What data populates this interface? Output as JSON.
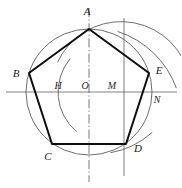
{
  "figure": {
    "background_color": "#ffffff",
    "ink_color": "#0d0d0d",
    "construction_color": "#5d5d5d",
    "axis_color": "#4a4a4a",
    "width": 181,
    "height": 188
  },
  "circle": {
    "center_label": "O",
    "center_x": 89,
    "center_y": 92,
    "radius": 63
  },
  "vertices": [
    {
      "label": "A",
      "x": 89,
      "y": 29,
      "label_x": 87,
      "label_y": 15
    },
    {
      "label": "B",
      "x": 29,
      "y": 73,
      "label_x": 16,
      "label_y": 77
    },
    {
      "label": "C",
      "x": 52,
      "y": 144,
      "label_x": 48,
      "label_y": 160
    },
    {
      "label": "D",
      "x": 126,
      "y": 144,
      "label_x": 138,
      "label_y": 152
    },
    {
      "label": "E",
      "x": 149,
      "y": 73,
      "label_x": 159,
      "label_y": 74
    }
  ],
  "construction_points": [
    {
      "label": "H",
      "x": 62,
      "y": 92,
      "label_x": 58,
      "label_y": 89
    },
    {
      "label": "O",
      "x": 89,
      "y": 92,
      "label_x": 85,
      "label_y": 89
    },
    {
      "label": "M",
      "x": 121,
      "y": 92,
      "label_x": 112,
      "label_y": 89
    },
    {
      "label": "N",
      "x": 152,
      "y": 92,
      "label_x": 157,
      "label_y": 103
    }
  ],
  "edges": [
    {
      "from": "A",
      "to": "B"
    },
    {
      "from": "B",
      "to": "C"
    },
    {
      "from": "C",
      "to": "D"
    },
    {
      "from": "D",
      "to": "E"
    },
    {
      "from": "E",
      "to": "A"
    }
  ],
  "axes": {
    "horizontal": {
      "x1": 6,
      "y1": 92,
      "x2": 177,
      "y2": 92
    },
    "vertical_center": {
      "x1": 89,
      "y1": 8,
      "x2": 89,
      "y2": 182
    },
    "vertical_right": {
      "x1": 124,
      "y1": 18,
      "x2": 124,
      "y2": 176
    }
  },
  "arcs": [
    {
      "name": "arc-M-through-A-and-D",
      "center_x": 121,
      "center_y": 92,
      "radius": 70,
      "start_angle_deg": 155,
      "end_angle_deg": 20
    },
    {
      "name": "arc-H-left",
      "center_x": 110,
      "center_y": 92,
      "radius": 52,
      "start_angle_deg": 140,
      "end_angle_deg": 230
    },
    {
      "name": "arc-upper-right-intersect",
      "center_x": 89,
      "center_y": 120,
      "radius": 93,
      "start_angle_deg": -72,
      "end_angle_deg": -20
    },
    {
      "name": "arc-lower-right-intersect",
      "center_x": 96,
      "center_y": 70,
      "radius": 84,
      "start_angle_deg": 48,
      "end_angle_deg": 80
    }
  ]
}
